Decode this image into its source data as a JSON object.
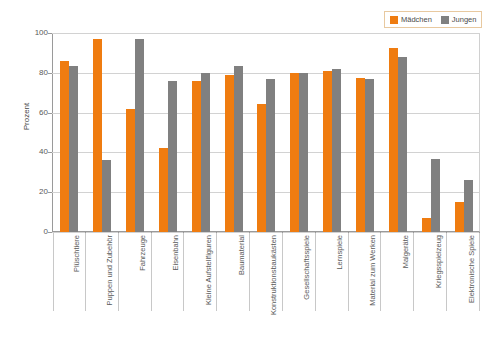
{
  "chart_data": {
    "type": "bar",
    "title": "",
    "subtitle": "",
    "xlabel": "",
    "ylabel": "Prozent",
    "ylim": [
      0,
      100
    ],
    "ytick_values": [
      100,
      80,
      60,
      40,
      20,
      0
    ],
    "ytick_labels": [
      "100",
      "80",
      "60",
      "40",
      "20",
      "0"
    ],
    "grid": true,
    "legend_position": "top-right",
    "categories": [
      "Plüschtiere",
      "Puppen und Zubehör",
      "Fahrzeuge",
      "Eisenbahn",
      "Kleine Aufstellfiguren",
      "Baumaterial",
      "Konstruktionsbaukästen",
      "Gesellschaftsspiele",
      "Lernspiele",
      "Material zum Werken",
      "Malgeräte",
      "Kriegsspielzeug",
      "Elektronische Spiele"
    ],
    "series": [
      {
        "name": "Mädchen",
        "color": "#ef7c10",
        "values": [
          86,
          97,
          62,
          42,
          76,
          79,
          64.5,
          80,
          81,
          77.5,
          92.5,
          7,
          15
        ]
      },
      {
        "name": "Jungen",
        "color": "#808080",
        "values": [
          83.5,
          36,
          97,
          76,
          80,
          83.5,
          77,
          80,
          82,
          77,
          88,
          36.5,
          26
        ]
      }
    ]
  },
  "legend": {
    "entries": [
      {
        "label": "Mädchen",
        "color": "#ef7c10"
      },
      {
        "label": "Jungen",
        "color": "#808080"
      }
    ]
  },
  "axes": {
    "y_title": "Prozent"
  }
}
